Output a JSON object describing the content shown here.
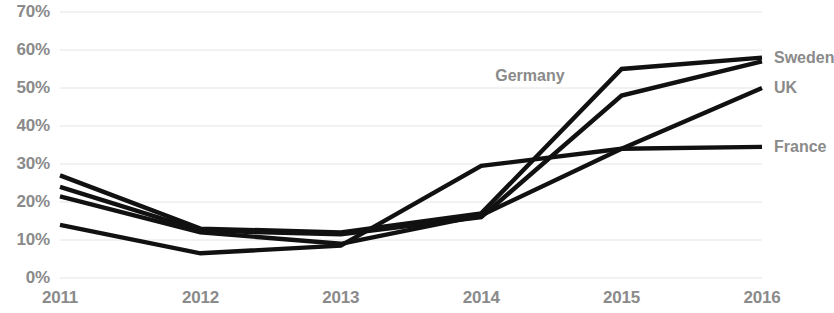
{
  "chart_data": {
    "type": "line",
    "title": "",
    "xlabel": "",
    "ylabel": "",
    "x": [
      "2011",
      "2012",
      "2013",
      "2014",
      "2015",
      "2016"
    ],
    "categories": [
      "2011",
      "2012",
      "2013",
      "2014",
      "2015",
      "2016"
    ],
    "ylim": [
      0,
      70
    ],
    "ytick_labels": [
      "0%",
      "10%",
      "20%",
      "30%",
      "40%",
      "50%",
      "60%",
      "70%"
    ],
    "ytick_values": [
      0,
      10,
      20,
      30,
      40,
      50,
      60,
      70
    ],
    "grid": true,
    "legend_position": "right-inline",
    "line_color": "#111111",
    "grid_color": "#e4e4e4",
    "label_color": "#8a8a8a",
    "series": [
      {
        "name": "Sweden",
        "values": [
          27.0,
          13.0,
          12.0,
          17.0,
          55.0,
          58.0
        ]
      },
      {
        "name": "Germany",
        "values": [
          24.0,
          12.5,
          11.5,
          16.0,
          48.0,
          57.0
        ]
      },
      {
        "name": "UK",
        "values": [
          21.5,
          12.0,
          9.0,
          16.5,
          34.0,
          50.0
        ]
      },
      {
        "name": "France",
        "values": [
          14.0,
          6.5,
          8.5,
          29.5,
          34.0,
          34.5
        ]
      }
    ],
    "annotations": [
      {
        "text": "Germany",
        "x": "2014",
        "y": 53
      }
    ]
  },
  "axis": {
    "y_labels": [
      "70%",
      "60%",
      "50%",
      "40%",
      "30%",
      "20%",
      "10%",
      "0%"
    ],
    "x_labels": [
      "2011",
      "2012",
      "2013",
      "2014",
      "2015",
      "2016"
    ]
  },
  "legend": {
    "items": [
      {
        "label": "Sweden"
      },
      {
        "label": "UK"
      },
      {
        "label": "France"
      }
    ]
  }
}
